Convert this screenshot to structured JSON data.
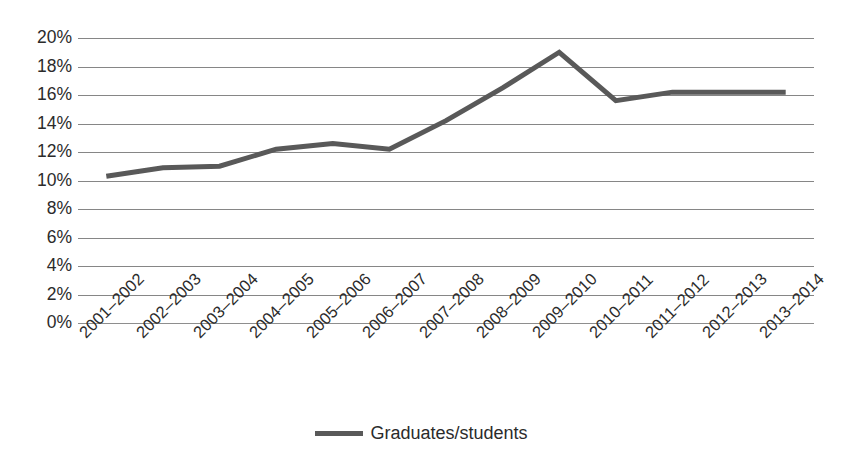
{
  "chart_data": {
    "type": "line",
    "title": "",
    "subtitle": "",
    "xlabel": "",
    "ylabel": "",
    "categories": [
      "2001–2002",
      "2002–2003",
      "2003–2004",
      "2004–2005",
      "2005–2006",
      "2006–2007",
      "2007–2008",
      "2008–2009",
      "2009–2010",
      "2010–2011",
      "2011–2012",
      "2012–2013",
      "2013–2014"
    ],
    "series": [
      {
        "name": "Graduates/students",
        "color": "#595959",
        "values": [
          10.3,
          10.9,
          11.0,
          12.2,
          12.6,
          12.2,
          14.2,
          16.5,
          19.0,
          15.6,
          16.2,
          16.2,
          16.2
        ]
      }
    ],
    "ylim": [
      0,
      20
    ],
    "ytick_step": 2,
    "ytick_labels": [
      "20%",
      "18%",
      "16%",
      "14%",
      "12%",
      "10%",
      "8%",
      "6%",
      "4%",
      "2%",
      "0%"
    ],
    "ytick_values": [
      20,
      18,
      16,
      14,
      12,
      10,
      8,
      6,
      4,
      2,
      0
    ],
    "value_suffix": "%",
    "grid": {
      "horizontal": true,
      "vertical": false,
      "color": "#868686"
    },
    "legend": {
      "position": "bottom",
      "entries": [
        {
          "label": "Graduates/students",
          "color": "#595959"
        }
      ]
    },
    "xtick_rotation_degrees": -45,
    "markers": "none",
    "line_width_px": 5
  }
}
